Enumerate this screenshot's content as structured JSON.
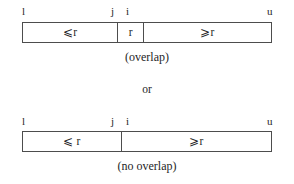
{
  "figure": {
    "ink_color": "#1f1f1f",
    "line_color": "#4d4d4d",
    "background": "#ffffff",
    "connector": "or"
  },
  "diagrams": [
    {
      "name": "overlap",
      "caption": "(overlap)",
      "endpoints": [
        {
          "label": "l",
          "x": 22
        },
        {
          "label": "j",
          "x": 111
        },
        {
          "label": "i",
          "x": 126
        },
        {
          "label": "u",
          "x": 267
        }
      ],
      "segments": [
        {
          "label": "⩽r",
          "relation": "⩽",
          "operand": "r",
          "flex": 96
        },
        {
          "label": "r",
          "relation": "",
          "operand": "r",
          "flex": 25
        },
        {
          "label": "⩾r",
          "relation": "⩾",
          "operand": "r",
          "flex": 129
        }
      ]
    },
    {
      "name": "no-overlap",
      "caption": "(no overlap)",
      "endpoints": [
        {
          "label": "l",
          "x": 22
        },
        {
          "label": "j",
          "x": 111
        },
        {
          "label": "i",
          "x": 126
        },
        {
          "label": "u",
          "x": 267
        }
      ],
      "segments": [
        {
          "label": "⩽ r",
          "relation": "⩽",
          "operand": "r",
          "flex": 99
        },
        {
          "label": "⩾r",
          "relation": "⩾",
          "operand": "r",
          "flex": 151
        }
      ]
    }
  ]
}
